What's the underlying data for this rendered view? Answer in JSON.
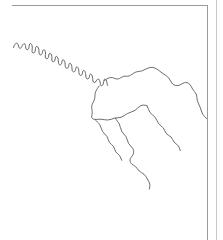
{
  "figure": {
    "kind": "line-map",
    "title_partial": "g",
    "background_color": "#ffffff",
    "line_color": "#5b5b5b",
    "frame_color": "#9a9a9a",
    "outer_edge_color": "#c9c9c9"
  },
  "frame": {
    "name": "map-neatline",
    "x": 11,
    "y": 5.5,
    "width": 196,
    "height": 234,
    "right_edge_x": 216
  },
  "map_data": {
    "type": "line-map",
    "feature_class": "hydrography",
    "description": "Unlabelled line drawing of a braided river / drainage network: a highly sinuous main stem descends from the upper-left corner to a confluence near the centre, where it opens into a broad loop and splits into three distributaries that trend south-east toward the right-hand map border.",
    "features": [
      {
        "name": "main-stem-meanders",
        "label": "",
        "style": "river-main",
        "note": "tightly meandering channel entering at upper-left, trending south-east",
        "path": "M 13.5,47.5 C 14.6,44.2 16.0,42.4 17.4,43.6 C 18.6,44.7 18.5,47.3 19.6,48.2 C 20.7,49.1 21.6,47.0 22.4,45.4 C 23.2,43.9 24.2,42.9 25.0,44.1 C 25.8,45.3 25.4,48.2 26.3,49.3 C 27.3,50.5 28.5,49.4 28.9,47.6 C 29.3,45.9 29.1,44.0 30.2,43.6 C 31.4,43.2 32.2,45.3 32.3,47.3 C 32.4,49.3 31.6,51.3 32.3,52.4 C 33.1,53.6 34.6,52.9 35.1,51.3 C 35.6,49.7 35.2,47.3 36.2,46.6 C 37.2,45.9 38.4,47.3 38.8,49.1 C 39.2,50.9 38.7,53.2 39.4,54.3 C 40.2,55.5 41.6,54.9 42.1,53.6 C 42.7,52.2 42.5,50.2 43.5,49.8 C 44.6,49.4 45.4,51.1 45.5,53.0 C 45.6,54.9 44.9,56.9 45.6,58.1 C 46.4,59.4 47.9,58.8 48.4,57.3 C 48.9,55.9 48.6,53.9 49.6,53.4 C 50.7,52.9 51.6,54.5 51.8,56.3 C 52.0,58.1 51.5,60.1 52.2,61.2 C 53.0,62.4 54.5,61.7 54.9,60.2 C 55.3,58.8 55.0,56.8 56.0,56.4 C 57.0,56.0 57.9,57.6 58.2,59.4 C 58.5,61.2 58.2,63.2 59.0,64.3 C 59.9,65.5 61.3,64.8 61.7,63.3 C 62.1,61.9 61.9,60.1 62.9,59.8 C 63.9,59.5 64.7,61.1 65.0,62.8 C 65.3,64.6 65.0,66.6 65.8,67.7 C 66.7,68.9 68.1,68.2 68.5,66.8 C 68.9,65.4 68.7,63.6 69.7,63.3 C 70.7,63.0 71.5,64.6 71.8,66.4 C 72.1,68.2 71.8,70.2 72.7,71.3 C 73.6,72.5 75.0,71.7 75.4,70.3 C 75.8,69.0 75.6,67.2 76.6,66.9 C 77.6,66.6 78.4,68.2 78.7,69.9 C 79.0,71.7 78.7,73.7 79.6,74.8 C 80.5,76.0 81.9,75.2 82.3,73.9 C 82.7,72.5 82.5,70.8 83.5,70.5 C 84.5,70.2 85.3,71.8 85.6,73.5 C 85.9,75.3 85.6,77.3 86.5,78.4 C 87.4,79.6 88.8,78.8 89.2,77.5 C 89.6,76.1 89.4,74.4 90.4,74.1 C 91.4,73.8 92.2,75.4 92.5,77.1 C 92.8,78.9 92.5,80.9 93.4,82.0 C 94.0,82.8 94.9,82.6 95.6,81.8"
      },
      {
        "name": "confluence-knot",
        "label": "",
        "style": "river",
        "note": "tangled confluence node just right of the meander belt",
        "path": "M 95.6,81.8 C 96.4,80.8 97.0,79.2 98.0,79.0 C 99.1,78.8 99.8,80.3 100.1,82.0 C 100.4,83.6 100.2,85.4 101.2,85.8 C 102.3,86.2 103.2,84.7 103.5,83.0 C 103.8,81.3 103.6,79.4 104.7,79.2 C 105.8,79.0 106.6,80.5 106.9,82.2 C 107.1,83.5 107.0,84.9 107.6,85.6"
      },
      {
        "name": "north-bank-arc",
        "label": "",
        "style": "river",
        "note": "broad northern arc sweeping east then curving down to the right border",
        "path": "M 104.5,80.6 C 106.8,78.4 109.6,77.2 112.2,77.6 C 114.3,77.9 115.8,79.3 117.9,79.0 C 120.0,78.7 121.4,77.0 123.5,76.4 C 125.6,75.8 127.4,76.6 129.3,75.9 C 131.5,75.2 132.9,73.3 135.0,72.4 C 137.5,71.3 140.0,71.5 142.4,70.7 C 144.9,69.9 146.8,68.2 149.3,67.6 C 151.7,67.0 154.0,67.6 156.2,68.7 C 158.4,69.8 160.1,71.6 162.3,73.1 C 164.6,74.7 167.1,76.0 168.8,78.0 C 170.4,79.9 170.8,82.3 172.5,83.9 C 174.4,85.6 177.0,86.0 179.2,85.3 C 181.1,84.7 182.4,83.2 184.3,82.7 C 186.3,82.2 188.3,82.8 189.8,84.3 C 191.1,85.6 191.6,87.5 192.6,89.1 C 193.7,90.9 195.4,92.2 196.2,94.1 C 197.0,96.1 196.8,98.3 197.3,100.4 C 197.9,102.9 199.3,105.0 200.2,107.4 C 201.1,109.7 201.5,112.3 202.8,114.4 C 203.8,116.1 205.3,117.3 206.6,118.6"
      },
      {
        "name": "south-bank-arc",
        "label": "",
        "style": "river",
        "note": "southern bank of the central loop, running east from the confluence",
        "path": "M 99.2,86.0 C 98.0,88.0 96.4,89.5 95.6,91.7 C 94.7,94.1 95.2,96.8 94.5,99.2 C 93.8,101.6 92.2,103.4 91.8,105.8 C 91.4,108.3 92.4,110.8 92.2,113.2 C 92.1,114.8 91.5,116.1 91.7,117.3 C 92.0,118.6 93.2,119.2 94.6,119.4 C 96.7,119.7 98.8,119.1 100.9,119.2 C 103.2,119.3 105.3,120.1 107.6,120.0 C 110.0,119.9 112.1,118.8 114.4,118.3 C 116.7,117.8 119.0,117.9 121.2,117.2 C 123.6,116.4 125.4,114.5 127.7,113.4 C 130.1,112.2 132.8,111.8 135.0,110.4 C 137.0,109.1 138.2,107.0 140.3,105.9 C 142.4,104.8 144.9,104.8 147.0,105.8"
      },
      {
        "name": "distributary-east",
        "label": "",
        "style": "river",
        "note": "eastern distributary descending from the loop toward the lower right",
        "path": "M 147.0,105.8 C 148.3,107.9 148.6,110.5 150.0,112.5 C 151.4,114.5 153.7,115.5 155.2,117.4 C 156.7,119.3 157.2,121.8 158.7,123.7 C 160.0,125.4 162.0,126.3 163.3,128.0 C 164.6,129.7 165.0,132.0 166.4,133.6 C 167.7,135.1 169.7,135.7 171.1,137.1 C 172.4,138.5 172.9,140.6 174.1,142.1 C 175.3,143.6 177.1,144.3 178.3,145.8 C 179.3,147.1 179.7,148.9 180.2,150.5"
      },
      {
        "name": "distributary-central",
        "label": "",
        "style": "river",
        "note": "central distributary running south-east from the loop's south bank",
        "path": "M 115.3,117.9 C 116.3,120.2 118.2,121.8 119.3,124.0 C 120.4,126.3 120.5,129.0 121.7,131.2 C 122.8,133.3 124.8,134.6 126.0,136.6 C 127.2,138.7 127.4,141.4 128.6,143.5 C 129.8,145.5 131.8,146.7 132.9,148.7 C 133.9,150.6 133.9,153.0 132.9,154.9 C 132.2,156.3 130.9,157.2 130.3,158.6 C 129.6,160.3 130.2,162.3 131.4,163.6 C 132.6,164.9 134.3,165.5 135.6,166.7 C 137.0,167.9 137.9,169.7 139.2,171.0 C 140.6,172.4 142.5,173.0 144.0,174.2 C 145.4,175.4 146.3,177.2 147.3,178.9 C 148.3,180.6 149.4,182.3 149.8,184.2 C 150.1,185.8 149.8,187.4 149.4,189.0"
      },
      {
        "name": "distributary-west",
        "label": "",
        "style": "river",
        "note": "western distributary leaving the south bank and trending south",
        "path": "M 95.0,119.3 C 96.3,121.5 98.5,122.6 99.8,124.7 C 101.1,126.8 101.3,129.5 102.6,131.6 C 103.8,133.5 105.8,134.6 107.0,136.5 C 108.1,138.3 108.2,140.7 109.4,142.4 C 110.5,144.0 112.4,144.8 113.5,146.4 C 114.6,148.0 114.7,150.2 115.8,151.9 C 116.8,153.4 118.5,154.2 119.6,155.7 C 120.6,157.0 121.0,158.8 121.7,160.3"
      }
    ]
  }
}
